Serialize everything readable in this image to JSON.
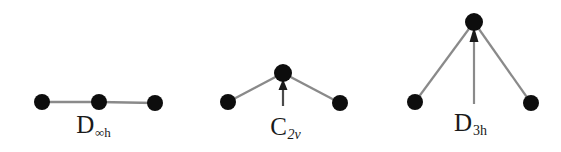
{
  "figure": {
    "title_visible": false,
    "background_color": "#ffffff",
    "width": 561,
    "height": 152,
    "atom_color": "#0d0d0d",
    "bond_color": "#8a8a8a",
    "arrow_color": "#6f6f6f",
    "label_color": "#1a1a1a"
  },
  "diagrams": [
    {
      "id": "linear-molecule",
      "name": "linear-triatomic-diagram",
      "geometry": "linear",
      "point_group": {
        "symbol": "D",
        "subscript": "∞h",
        "full": "D∞h"
      },
      "atoms": [
        {
          "name": "atom-left",
          "x": 42,
          "y": 102,
          "r": 8
        },
        {
          "name": "atom-center",
          "x": 99,
          "y": 102,
          "r": 8
        },
        {
          "name": "atom-right",
          "x": 155,
          "y": 103,
          "r": 8
        }
      ],
      "bonds": [
        {
          "name": "bond-left",
          "x1": 42,
          "y1": 102,
          "x2": 99,
          "y2": 102
        },
        {
          "name": "bond-right",
          "x1": 99,
          "y1": 102,
          "x2": 155,
          "y2": 103
        }
      ],
      "dipole_arrow": null,
      "label_position": {
        "x": 104,
        "y": 112
      }
    },
    {
      "id": "bent-molecule",
      "name": "bent-triatomic-diagram",
      "geometry": "bent",
      "point_group": {
        "symbol": "C",
        "subscript": "2v",
        "full": "C2v"
      },
      "atoms": [
        {
          "name": "atom-left",
          "x": 228,
          "y": 102,
          "r": 8
        },
        {
          "name": "atom-apex",
          "x": 283,
          "y": 73,
          "r": 9
        },
        {
          "name": "atom-right",
          "x": 340,
          "y": 103,
          "r": 8
        }
      ],
      "bonds": [
        {
          "name": "bond-left",
          "x1": 228,
          "y1": 102,
          "x2": 283,
          "y2": 73
        },
        {
          "name": "bond-right",
          "x1": 283,
          "y1": 73,
          "x2": 340,
          "y2": 103
        }
      ],
      "dipole_arrow": {
        "name": "dipole-arrow",
        "x": 283,
        "y_tail": 106,
        "y_head": 82,
        "head_width": 9,
        "head_length": 10
      },
      "label_position": {
        "x": 285,
        "y": 114
      }
    },
    {
      "id": "trigonal-molecule",
      "name": "trigonal-planar-diagram",
      "geometry": "wide-bent",
      "point_group": {
        "symbol": "D",
        "subscript": "3h",
        "full": "D3h"
      },
      "atoms": [
        {
          "name": "atom-left",
          "x": 415,
          "y": 102,
          "r": 8
        },
        {
          "name": "atom-apex",
          "x": 474,
          "y": 22,
          "r": 9
        },
        {
          "name": "atom-right",
          "x": 531,
          "y": 103,
          "r": 8
        }
      ],
      "bonds": [
        {
          "name": "bond-left",
          "x1": 415,
          "y1": 102,
          "x2": 474,
          "y2": 22
        },
        {
          "name": "bond-right",
          "x1": 474,
          "y1": 22,
          "x2": 531,
          "y2": 103
        }
      ],
      "dipole_arrow": {
        "name": "dipole-arrow",
        "x": 474,
        "y_tail": 104,
        "y_head": 30,
        "head_width": 9,
        "head_length": 12
      },
      "label_position": {
        "x": 476,
        "y": 110
      }
    }
  ]
}
